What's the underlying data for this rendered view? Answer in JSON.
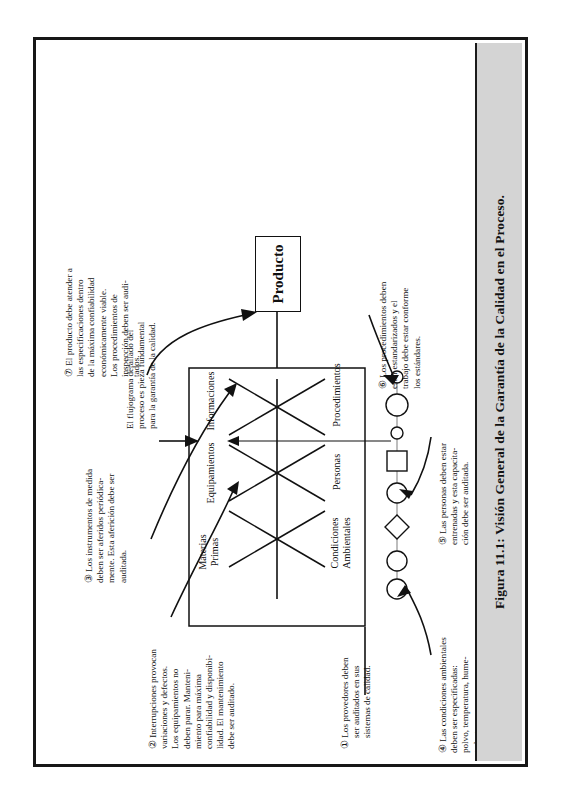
{
  "figure": {
    "caption": "Figura 11.1: Visión General de la Garantía de la Calidad en el Proceso.",
    "band_color": "#d4d4d4",
    "frame_color": "#171717"
  },
  "diagram": {
    "product_box": "Producto",
    "flow_note": {
      "line1": "El flujograma detallado del",
      "line2": "proceso es pieza fundamental",
      "line3": "para la garantía de la calidad."
    },
    "fishbone_top_labels": [
      "Materias\nPrimas",
      "Equipamientos",
      "Informaciones"
    ],
    "fishbone_bottom_labels": [
      "Condiciones\nAmbientales",
      "Personas",
      "Procedimientos"
    ],
    "bones": {
      "materias_primas": "Materias\nPrimas",
      "equipamientos": "Equipamientos",
      "informaciones": "Informaciones",
      "condiciones_ambientales": "Condiciones\nAmbientales",
      "personas": "Personas",
      "procedimientos": "Procedimientos"
    },
    "flow_shapes": [
      "circle",
      "circle",
      "diamond",
      "circle",
      "square",
      "small-circle",
      "circle",
      "small-circle"
    ]
  },
  "notes": [
    {
      "id": 1,
      "marker": "①",
      "lines": [
        "Los provedores deben",
        "ser auditados en sus",
        "sistemas de calidad."
      ],
      "text": "① Los provedores deben ser auditados en sus sistemas de calidad."
    },
    {
      "id": 2,
      "marker": "②",
      "lines": [
        "Interrupciones provocan",
        "variaciones y defectos.",
        "Los equipamientos no",
        "deben parar. Manteni-",
        "miento para máxima",
        "confiabilidad y disponibi-",
        "lidad. El mantenimiento",
        "debe ser auditado."
      ],
      "text": "② Interrupciones provocan variaciones y defectos. Los equipamientos no deben parar. Mantenimiento para máxima confiabilidad y disponibilidad. El mantenimiento debe ser auditado."
    },
    {
      "id": 3,
      "marker": "③",
      "lines": [
        "Los instrumentos de medida",
        "deben ser aferidos periódica-",
        "mente. Esta aferición debe ser",
        "auditada."
      ],
      "text": "③ Los instrumentos de medida deben ser aferidos periódicamente. Esta aferición debe ser auditada."
    },
    {
      "id": 4,
      "marker": "④",
      "lines": [
        "Las condiciones ambientales",
        "deben ser especificadas:",
        "polvo, temperatura, hume-",
        "tad, etc."
      ],
      "text": "④ Las condiciones ambientales deben ser especificadas: polvo, temperatura, humetad, etc."
    },
    {
      "id": 5,
      "marker": "⑤",
      "lines": [
        "Las personas deben estar",
        "entrenadas y esta capacita-",
        "ción debe ser auditada."
      ],
      "text": "⑤ Las personas deben estar entrenadas y esta capacitación debe ser auditada."
    },
    {
      "id": 6,
      "marker": "⑥",
      "lines": [
        "Los procedimientos deben",
        "estar estandarizados y el",
        "trabajo debe estar conforme",
        "los estándares."
      ],
      "text": "⑥ Los procedimientos deben estar estandarizados y el trabajo debe estar conforme los estándares."
    },
    {
      "id": 7,
      "marker": "⑦",
      "lines": [
        "El producto debe atender a",
        "las especificaciones dentro",
        "de la máxima confiabilidad",
        "económicamente viable.",
        "Los procedimientos de",
        "inspección deben ser audi-",
        "tados."
      ],
      "text": "⑦ El producto debe atender a las especificaciones dentro de la máxima confiabilidad económicamente viable. Los procedimientos de inspección deben ser auditados."
    }
  ]
}
